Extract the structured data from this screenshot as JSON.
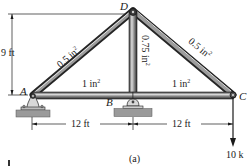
{
  "figure": {
    "caption": "(a)",
    "joints": [
      {
        "id": "A",
        "label": "A"
      },
      {
        "id": "B",
        "label": "B"
      },
      {
        "id": "C",
        "label": "C"
      },
      {
        "id": "D",
        "label": "D"
      }
    ],
    "members": [
      {
        "id": "AD",
        "area_value": "0.5 in",
        "area_exp": "2"
      },
      {
        "id": "DC",
        "area_value": "0.5 in",
        "area_exp": "2"
      },
      {
        "id": "BD",
        "area_value": "0.75 in",
        "area_exp": "2"
      },
      {
        "id": "AB",
        "area_value": "1 in",
        "area_exp": "2"
      },
      {
        "id": "BC",
        "area_value": "1 in",
        "area_exp": "2"
      }
    ],
    "dimensions": {
      "height": "9 ft",
      "span_left": "12 ft",
      "span_right": "12 ft"
    },
    "load": {
      "label": "10 k",
      "joint": "C",
      "direction": "down"
    },
    "colors": {
      "member_dark": "#2b2b2b",
      "member_light": "#d8d8d8",
      "support_fill": "#9a9a9a",
      "line": "#1a1a1a"
    }
  }
}
